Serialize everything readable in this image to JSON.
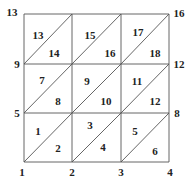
{
  "diagram": {
    "type": "triangulated-grid",
    "grid": {
      "columns": 3,
      "rows": 3,
      "x": [
        24,
        72,
        121,
        169
      ],
      "y": [
        14,
        64,
        113,
        162
      ]
    },
    "line_color": "#555555",
    "text_color": "#222222",
    "vertex_labels": [
      {
        "id": "v1",
        "text": "1",
        "x": 22,
        "y": 172
      },
      {
        "id": "v2",
        "text": "2",
        "x": 72,
        "y": 172
      },
      {
        "id": "v3",
        "text": "3",
        "x": 121,
        "y": 172
      },
      {
        "id": "v4",
        "text": "4",
        "x": 170,
        "y": 172
      },
      {
        "id": "v5",
        "text": "5",
        "x": 17,
        "y": 113
      },
      {
        "id": "v8",
        "text": "8",
        "x": 177,
        "y": 113
      },
      {
        "id": "v9",
        "text": "9",
        "x": 17,
        "y": 64
      },
      {
        "id": "v12",
        "text": "12",
        "x": 179,
        "y": 64
      },
      {
        "id": "v13",
        "text": "13",
        "x": 12,
        "y": 12
      },
      {
        "id": "v16",
        "text": "16",
        "x": 179,
        "y": 13
      }
    ],
    "triangle_labels": [
      {
        "id": "t1",
        "text": "1",
        "x": 38,
        "y": 131
      },
      {
        "id": "t2",
        "text": "2",
        "x": 58,
        "y": 148
      },
      {
        "id": "t3",
        "text": "3",
        "x": 90,
        "y": 125
      },
      {
        "id": "t4",
        "text": "4",
        "x": 103,
        "y": 147
      },
      {
        "id": "t5",
        "text": "5",
        "x": 135,
        "y": 131
      },
      {
        "id": "t6",
        "text": "6",
        "x": 155,
        "y": 151
      },
      {
        "id": "t7",
        "text": "7",
        "x": 42,
        "y": 80
      },
      {
        "id": "t8",
        "text": "8",
        "x": 58,
        "y": 101
      },
      {
        "id": "t9",
        "text": "9",
        "x": 87,
        "y": 81
      },
      {
        "id": "t10",
        "text": "10",
        "x": 106,
        "y": 101
      },
      {
        "id": "t11",
        "text": "11",
        "x": 137,
        "y": 81
      },
      {
        "id": "t12",
        "text": "12",
        "x": 155,
        "y": 101
      },
      {
        "id": "t13",
        "text": "13",
        "x": 38,
        "y": 35
      },
      {
        "id": "t14",
        "text": "14",
        "x": 54,
        "y": 53
      },
      {
        "id": "t15",
        "text": "15",
        "x": 90,
        "y": 35
      },
      {
        "id": "t16",
        "text": "16",
        "x": 110,
        "y": 53
      },
      {
        "id": "t17",
        "text": "17",
        "x": 138,
        "y": 32
      },
      {
        "id": "t18",
        "text": "18",
        "x": 155,
        "y": 53
      }
    ]
  }
}
